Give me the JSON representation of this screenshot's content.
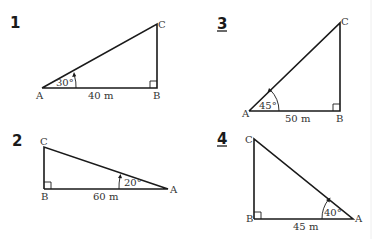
{
  "problems": [
    {
      "number": "1",
      "underlined": false,
      "vertices": {
        "A": "A",
        "B": "B",
        "C": "C"
      },
      "angle_label": "30°",
      "side_label": "40 m",
      "angle_deg": 30,
      "side_length_m": 40
    },
    {
      "number": "2",
      "underlined": false,
      "vertices": {
        "A": "A",
        "B": "B",
        "C": "C"
      },
      "angle_label": "20°",
      "side_label": "60 m",
      "angle_deg": 20,
      "side_length_m": 60
    },
    {
      "number": "3",
      "underlined": true,
      "vertices": {
        "A": "A",
        "B": "B",
        "C": "C"
      },
      "angle_label": "45°",
      "side_label": "50 m",
      "angle_deg": 45,
      "side_length_m": 50
    },
    {
      "number": "4",
      "underlined": true,
      "vertices": {
        "A": "A",
        "B": "B",
        "C": "C"
      },
      "angle_label": "40°",
      "side_label": "45 m",
      "angle_deg": 40,
      "side_length_m": 45
    }
  ],
  "colors": {
    "line": "#1a1a1a",
    "text": "#333333",
    "background": "#ffffff"
  }
}
